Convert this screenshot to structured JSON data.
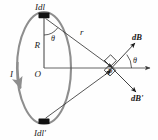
{
  "figure": {
    "background_color": "#fefefe",
    "labels": {
      "current_element_top": "Idl",
      "current_element_bottom": "Idl'",
      "current": "I",
      "radius": "R",
      "center": "O",
      "distance": "r",
      "angle_top": "θ",
      "angle_right": "θ",
      "field_upper": "dB",
      "field_lower": "dB'",
      "field_point": "P"
    },
    "colors": {
      "loop": "#8e8e8e",
      "lines": "#2b2b2b",
      "axis": "#555555",
      "text": "#1a1a1a",
      "element_marker": "#111111"
    },
    "geometry": {
      "loop_center": [
        44,
        68
      ],
      "loop_rx": 27,
      "loop_ry": 56,
      "point_p": [
        113,
        68
      ],
      "element_top": [
        44,
        16
      ],
      "element_bottom": [
        44,
        121
      ]
    },
    "elements": [
      "current-loop-ellipse",
      "current-direction-arrow",
      "radius-line",
      "horizontal-axis",
      "r-line-upper",
      "r-line-lower",
      "dB-vector",
      "dB-prime-vector",
      "right-angle-marker-upper",
      "right-angle-marker-lower",
      "theta-arc-top",
      "theta-arc-right"
    ]
  }
}
